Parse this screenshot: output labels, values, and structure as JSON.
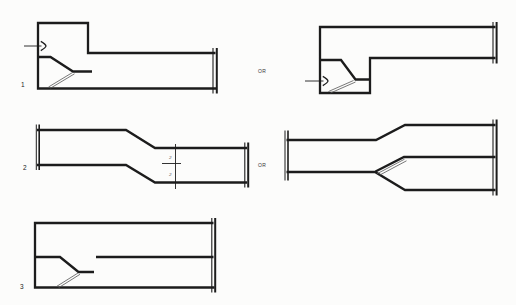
{
  "page": {
    "background": "#fcfcfb",
    "ink": "#1c1c1c",
    "thin_ink": "#555"
  },
  "labels": {
    "fig1": "1",
    "fig2": "2",
    "fig3": "3",
    "or_row1": "OR",
    "or_row2": "OR",
    "dim_upper": "2",
    "dim_lower": "2"
  },
  "figures": [
    {
      "id": "fig1-left",
      "strokes": [
        {
          "k": "poly",
          "w": 2.3,
          "n": "duct-outline",
          "pts": [
            [
              215.5,
              53
            ],
            [
              88,
              53
            ],
            [
              88,
              23
            ],
            [
              38,
              23
            ],
            [
              38,
              88.5
            ],
            [
              216.5,
              88.5
            ]
          ]
        },
        {
          "k": "poly",
          "w": 2.3,
          "n": "splitter-vane",
          "pts": [
            [
              38,
              57
            ],
            [
              50.5,
              57
            ],
            [
              73,
              71.5
            ],
            [
              92,
              71.5
            ]
          ]
        },
        {
          "k": "poly",
          "w": 1.1,
          "n": "break-line",
          "pts": [
            [
              213,
              48
            ],
            [
              213,
              93.5
            ]
          ]
        },
        {
          "k": "poly",
          "w": 2.0,
          "n": "break-line",
          "pts": [
            [
              216.8,
              48
            ],
            [
              216.8,
              93.5
            ]
          ]
        },
        {
          "k": "poly",
          "w": 0.9,
          "n": "flow-arrow-shaft",
          "pts": [
            [
              24,
              46
            ],
            [
              41.5,
              46
            ]
          ]
        },
        {
          "k": "chev",
          "w": 1.3,
          "n": "flow-arrow-icon",
          "tip": [
            46,
            46
          ]
        },
        {
          "k": "poly",
          "w": 0.8,
          "c": "#555",
          "n": "vane-plate-line",
          "pts": [
            [
              48.5,
              87
            ],
            [
              72.5,
              72.5
            ]
          ]
        },
        {
          "k": "poly",
          "w": 0.8,
          "c": "#555",
          "n": "vane-plate-line",
          "pts": [
            [
              50.5,
              88.2
            ],
            [
              74.5,
              73.8
            ]
          ]
        }
      ]
    },
    {
      "id": "fig1-right",
      "strokes": [
        {
          "k": "poly",
          "w": 2.3,
          "n": "duct-outline",
          "pts": [
            [
              495.5,
              27
            ],
            [
              320,
              27
            ],
            [
              320,
              93
            ],
            [
              370,
              93
            ],
            [
              370,
              58
            ],
            [
              495.5,
              58
            ]
          ]
        },
        {
          "k": "poly",
          "w": 2.3,
          "n": "splitter-vane",
          "pts": [
            [
              320,
              60
            ],
            [
              341,
              60
            ],
            [
              355.5,
              79.5
            ],
            [
              370,
              79.5
            ]
          ]
        },
        {
          "k": "poly",
          "w": 1.1,
          "n": "break-line",
          "pts": [
            [
              493,
              22
            ],
            [
              493,
              63.5
            ]
          ]
        },
        {
          "k": "poly",
          "w": 2.0,
          "n": "break-line",
          "pts": [
            [
              496.6,
              22
            ],
            [
              496.6,
              63.5
            ]
          ]
        },
        {
          "k": "poly",
          "w": 0.9,
          "n": "flow-arrow-shaft",
          "pts": [
            [
              305,
              81
            ],
            [
              323.5,
              81
            ]
          ]
        },
        {
          "k": "chev",
          "w": 1.3,
          "n": "flow-arrow-icon",
          "tip": [
            328,
            81
          ]
        },
        {
          "k": "poly",
          "w": 0.8,
          "c": "#555",
          "n": "vane-plate-line",
          "pts": [
            [
              328.5,
              91.5
            ],
            [
              353.5,
              80.5
            ]
          ]
        },
        {
          "k": "poly",
          "w": 0.8,
          "c": "#555",
          "n": "vane-plate-line",
          "pts": [
            [
              330.5,
              93
            ],
            [
              355.5,
              82
            ]
          ]
        }
      ]
    },
    {
      "id": "fig2-left",
      "strokes": [
        {
          "k": "poly",
          "w": 2.3,
          "n": "duct-top-outline",
          "pts": [
            [
              37,
              130
            ],
            [
              126,
              130
            ],
            [
              155,
              148
            ],
            [
              247,
              148
            ]
          ]
        },
        {
          "k": "poly",
          "w": 2.3,
          "n": "duct-bottom-outline",
          "pts": [
            [
              37,
              165
            ],
            [
              126,
              165
            ],
            [
              155,
              182.5
            ],
            [
              247,
              182.5
            ]
          ]
        },
        {
          "k": "poly",
          "w": 1.0,
          "n": "break-line",
          "pts": [
            [
              36.3,
              124.5
            ],
            [
              36.3,
              170
            ]
          ]
        },
        {
          "k": "poly",
          "w": 1.6,
          "n": "break-line",
          "pts": [
            [
              39.2,
              124.5
            ],
            [
              39.2,
              170
            ]
          ]
        },
        {
          "k": "poly",
          "w": 1.1,
          "n": "break-line",
          "pts": [
            [
              244.8,
              142.5
            ],
            [
              244.8,
              187.5
            ]
          ]
        },
        {
          "k": "poly",
          "w": 2.0,
          "n": "break-line",
          "pts": [
            [
              248.2,
              142.5
            ],
            [
              248.2,
              187.5
            ]
          ]
        },
        {
          "k": "poly",
          "w": 0.9,
          "n": "centerline",
          "pts": [
            [
              175.5,
              144
            ],
            [
              175.5,
              189
            ]
          ]
        },
        {
          "k": "poly",
          "w": 0.9,
          "n": "dimension-line",
          "pts": [
            [
              162,
              163.5
            ],
            [
              181,
              163.5
            ]
          ]
        }
      ]
    },
    {
      "id": "fig2-right",
      "strokes": [
        {
          "k": "poly",
          "w": 2.3,
          "n": "duct-top-outline",
          "pts": [
            [
              286.5,
              140
            ],
            [
              376,
              140
            ],
            [
              405,
              125
            ],
            [
              495.5,
              125
            ]
          ]
        },
        {
          "k": "poly",
          "w": 2.3,
          "n": "duct-bottom-outline",
          "pts": [
            [
              286.5,
              172
            ],
            [
              375,
              172
            ],
            [
              405,
              190
            ],
            [
              495.5,
              190
            ]
          ]
        },
        {
          "k": "poly",
          "w": 2.3,
          "n": "splitter-vane",
          "pts": [
            [
              375.5,
              171.5
            ],
            [
              404,
              157
            ],
            [
              495.5,
              157
            ]
          ]
        },
        {
          "k": "poly",
          "w": 0.8,
          "c": "#555",
          "n": "vane-plate-line",
          "pts": [
            [
              377,
              173.8
            ],
            [
              404.5,
              159.2
            ]
          ]
        },
        {
          "k": "poly",
          "w": 0.8,
          "c": "#555",
          "n": "vane-plate-line",
          "pts": [
            [
              379.5,
              175.2
            ],
            [
              406.5,
              160.8
            ]
          ]
        },
        {
          "k": "poly",
          "w": 1.0,
          "n": "break-line",
          "pts": [
            [
              285,
              130.5
            ],
            [
              285,
              180.5
            ]
          ]
        },
        {
          "k": "poly",
          "w": 1.6,
          "n": "break-line",
          "pts": [
            [
              288,
              130.5
            ],
            [
              288,
              180.5
            ]
          ]
        },
        {
          "k": "poly",
          "w": 1.1,
          "n": "break-line",
          "pts": [
            [
              493,
              119.5
            ],
            [
              493,
              195.5
            ]
          ]
        },
        {
          "k": "poly",
          "w": 2.0,
          "n": "break-line",
          "pts": [
            [
              496.6,
              119.5
            ],
            [
              496.6,
              195.5
            ]
          ]
        }
      ]
    },
    {
      "id": "fig3",
      "strokes": [
        {
          "k": "poly",
          "w": 2.3,
          "n": "duct-outline",
          "pts": [
            [
              213.5,
              223
            ],
            [
              35,
              223
            ],
            [
              35,
              287.5
            ],
            [
              214.5,
              287.5
            ]
          ]
        },
        {
          "k": "poly",
          "w": 2.3,
          "n": "splitter-vane",
          "pts": [
            [
              35,
              257
            ],
            [
              60,
              257
            ],
            [
              78.5,
              272
            ],
            [
              94,
              272
            ]
          ]
        },
        {
          "k": "poly",
          "w": 2.3,
          "n": "mid-duct-line",
          "pts": [
            [
              96,
              257
            ],
            [
              213.5,
              257
            ]
          ]
        },
        {
          "k": "poly",
          "w": 1.1,
          "n": "break-line",
          "pts": [
            [
              211.8,
              218
            ],
            [
              211.8,
              292.5
            ]
          ]
        },
        {
          "k": "poly",
          "w": 2.0,
          "n": "break-line",
          "pts": [
            [
              215.2,
              218
            ],
            [
              215.2,
              292.5
            ]
          ]
        },
        {
          "k": "poly",
          "w": 0.8,
          "c": "#555",
          "n": "vane-plate-line",
          "pts": [
            [
              56.5,
              286.5
            ],
            [
              78,
              273
            ]
          ]
        },
        {
          "k": "poly",
          "w": 0.8,
          "c": "#555",
          "n": "vane-plate-line",
          "pts": [
            [
              58.5,
              287.8
            ],
            [
              80,
              274.3
            ]
          ]
        }
      ]
    }
  ]
}
